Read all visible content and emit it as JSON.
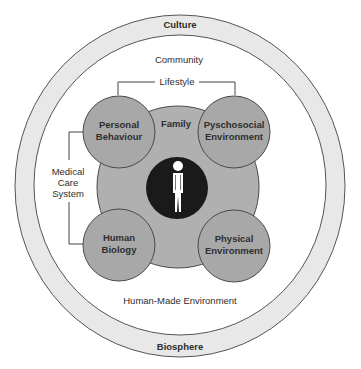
{
  "colors": {
    "ring_fill": "#e8e8e8",
    "ring_stroke": "#555555",
    "background": "#ffffff",
    "family_fill": "#b0b0b0",
    "factor_fill": "#a8a8a8",
    "circle_stroke": "#4a4a4a",
    "center_fill": "#1a1a1a",
    "person_fill": "#ffffff",
    "text": "#2e2e2e"
  },
  "outer_ring": {
    "top_label": "Culture",
    "bottom_label": "Biosphere"
  },
  "inner_area": {
    "top_label": "Community",
    "bottom_label": "Human-Made Environment"
  },
  "brackets": {
    "lifestyle": "Lifestyle",
    "medical_care": [
      "Medical",
      "Care",
      "System"
    ]
  },
  "family": {
    "label": "Family"
  },
  "factors": [
    {
      "id": "personal-behaviour",
      "lines": [
        "Personal",
        "Behaviour"
      ]
    },
    {
      "id": "psychosocial-environment",
      "lines": [
        "Pyschosocial",
        "Environment"
      ]
    },
    {
      "id": "human-biology",
      "lines": [
        "Human",
        "Biology"
      ]
    },
    {
      "id": "physical-environment",
      "lines": [
        "Physical",
        "Environment"
      ]
    }
  ],
  "center": {
    "icon": "person-icon"
  }
}
